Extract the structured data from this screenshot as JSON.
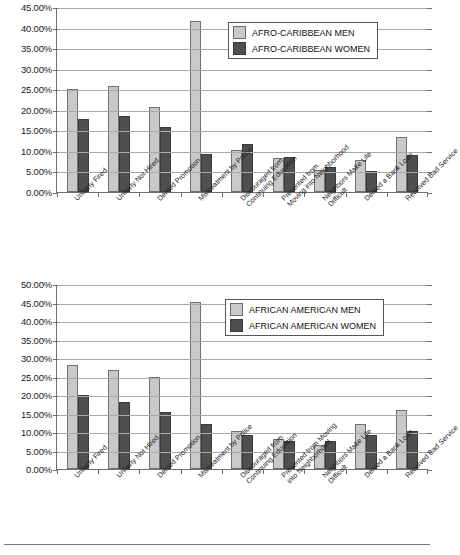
{
  "figure": {
    "background": "#ffffff",
    "men_color": "#c9c9c9",
    "women_color": "#4f4f4f",
    "footer_rule": true
  },
  "chart_data": [
    {
      "type": "bar",
      "id": "afro-caribbean",
      "title": "",
      "xlabel": "",
      "ylabel": "",
      "ylim": [
        0,
        45
      ],
      "ytick_values": [
        0,
        5,
        10,
        15,
        20,
        25,
        30,
        35,
        40,
        45
      ],
      "ytick_labels": [
        "0.00%",
        "5.00%",
        "10.00%",
        "15.00%",
        "20.00%",
        "25.00%",
        "30.00%",
        "35.00%",
        "40.00%",
        "45.00%"
      ],
      "grid": true,
      "legend_position": "top-right",
      "categories": [
        "Unfairly Fired",
        "Unfairly Not Hired",
        "Denied Promotion",
        "Mistreatment by Police",
        "Discouraged from Continuing Education",
        "Prevented from Moving into Neighborhood",
        "Neighbors Make Life Difficult",
        "Denied a Bank Loan",
        "Received Bad Service"
      ],
      "category_lines": [
        [
          "Unfairly Fired",
          ""
        ],
        [
          "Unfairly Not Hired",
          ""
        ],
        [
          "Denied Promotion",
          ""
        ],
        [
          "Mistreatment by Police",
          ""
        ],
        [
          "Discouraged from",
          "Continuing Education"
        ],
        [
          "Prevented from",
          "Moving into Neighborhood"
        ],
        [
          "Neighbors Make Life",
          "Difficult"
        ],
        [
          "Denied a Bank Loan",
          ""
        ],
        [
          "Received Bad Service",
          ""
        ]
      ],
      "series": [
        {
          "name": "AFRO-CARIBBEAN MEN",
          "color": "#c9c9c9",
          "values": [
            25.0,
            25.7,
            20.8,
            41.5,
            10.3,
            8.3,
            5.4,
            7.7,
            13.3
          ]
        },
        {
          "name": "AFRO-CARIBBEAN WOMEN",
          "color": "#4f4f4f",
          "values": [
            17.7,
            18.4,
            15.9,
            9.2,
            11.7,
            8.4,
            6.0,
            5.1,
            9.0
          ]
        }
      ]
    },
    {
      "type": "bar",
      "id": "african-american",
      "title": "",
      "xlabel": "",
      "ylabel": "",
      "ylim": [
        0,
        50
      ],
      "ytick_values": [
        0,
        5,
        10,
        15,
        20,
        25,
        30,
        35,
        40,
        45,
        50
      ],
      "ytick_labels": [
        "0.00%",
        "5.00%",
        "10.00%",
        "15.00%",
        "20.00%",
        "25.00%",
        "30.00%",
        "35.00%",
        "40.00%",
        "45.00%",
        "50.00%"
      ],
      "grid": true,
      "legend_position": "top-right",
      "categories": [
        "Unfairly Fired",
        "Unfairly Not Hired",
        "Denied Promotion",
        "Mistreatment by Police",
        "Discouraged from Continuing Education",
        "Prevented from Moving into Neighborhood",
        "Neighbors Make Life Difficult",
        "Denied a Bank Loan",
        "Received Bad Service"
      ],
      "category_lines": [
        [
          "Unfairly Fired",
          ""
        ],
        [
          "Unfairly Not Hired",
          ""
        ],
        [
          "Denied Promotion",
          ""
        ],
        [
          "Mistreatment by Police",
          ""
        ],
        [
          "Discouraged from",
          "Continuing Education"
        ],
        [
          "Prevented from Moving",
          "into Neighborhood"
        ],
        [
          "Neighbors Make Life",
          "Difficult"
        ],
        [
          "Denied a Bank Loan",
          ""
        ],
        [
          "Received Bad Service",
          ""
        ]
      ],
      "series": [
        {
          "name": "AFRICAN AMERICAN MEN",
          "color": "#c9c9c9",
          "values": [
            28.0,
            26.7,
            25.0,
            45.1,
            10.2,
            8.0,
            6.4,
            12.3,
            15.9
          ]
        },
        {
          "name": "AFRICAN AMERICAN WOMEN",
          "color": "#4f4f4f",
          "values": [
            20.1,
            18.1,
            15.5,
            12.3,
            9.2,
            7.6,
            7.6,
            9.2,
            10.3
          ]
        }
      ]
    }
  ]
}
